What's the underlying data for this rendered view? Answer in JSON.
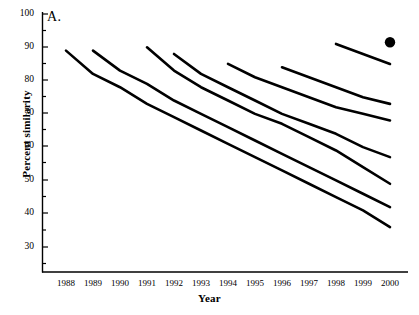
{
  "figure": {
    "panel_label": "A.",
    "background_color": "#ffffff",
    "line_color": "#000000",
    "axis_color": "#000000"
  },
  "chart_data": {
    "type": "line",
    "title": "A.",
    "xlabel": "Year",
    "ylabel": "Percent similarity",
    "xlim": [
      1987.3,
      2000.9
    ],
    "ylim": [
      26,
      100
    ],
    "grid": false,
    "legend": null,
    "x_ticks": [
      "1988",
      "1989",
      "1990",
      "1991",
      "1992",
      "1993",
      "1994",
      "1995",
      "1996",
      "1997",
      "1998",
      "1999",
      "2000"
    ],
    "y_ticks": [
      "30",
      "40",
      "50",
      "60",
      "70",
      "80",
      "90",
      "100"
    ],
    "series": [
      {
        "name": "cohort-1988",
        "x": [
          1988,
          1989,
          1990,
          1991,
          1992,
          1993,
          1994,
          1995,
          1996,
          1997,
          1998,
          1999,
          2000
        ],
        "values": [
          89,
          82,
          78,
          73,
          69,
          65,
          61,
          57,
          53,
          49,
          45,
          41,
          36
        ]
      },
      {
        "name": "cohort-1989",
        "x": [
          1989,
          1990,
          1991,
          1992,
          1993,
          1994,
          1995,
          1996,
          1997,
          1998,
          1999,
          2000
        ],
        "values": [
          89,
          83,
          79,
          74,
          70,
          66,
          62,
          58,
          54,
          50,
          46,
          42
        ]
      },
      {
        "name": "cohort-1991",
        "x": [
          1991,
          1992,
          1993,
          1994,
          1995,
          1996,
          1997,
          1998,
          1999,
          2000
        ],
        "values": [
          90,
          83,
          78,
          74,
          70,
          67,
          63,
          59,
          54,
          49
        ]
      },
      {
        "name": "cohort-1992",
        "x": [
          1992,
          1993,
          1994,
          1995,
          1996,
          1997,
          1998,
          1999,
          2000
        ],
        "values": [
          88,
          82,
          78,
          74,
          70,
          67,
          64,
          60,
          57
        ]
      },
      {
        "name": "cohort-1994",
        "x": [
          1994,
          1995,
          1996,
          1997,
          1998,
          1999,
          2000
        ],
        "values": [
          85,
          81,
          78,
          75,
          72,
          70,
          68
        ]
      },
      {
        "name": "cohort-1996",
        "x": [
          1996,
          1997,
          1998,
          1999,
          2000
        ],
        "values": [
          84,
          81,
          78,
          75,
          73
        ]
      },
      {
        "name": "cohort-1998",
        "x": [
          1998,
          1999,
          2000
        ],
        "values": [
          91,
          88,
          85
        ]
      }
    ],
    "markers": [
      {
        "name": "solid-point-2000",
        "x": 2000,
        "y": 91.5,
        "style": "filled-circle",
        "color": "#000000"
      }
    ]
  }
}
